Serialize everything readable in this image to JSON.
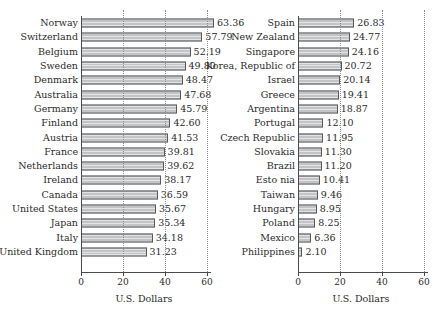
{
  "chart_data": [
    {
      "type": "bar",
      "orientation": "horizontal",
      "panel": "left",
      "title": "",
      "xlabel": "U.S. Dollars",
      "ylabel": "",
      "xlim": [
        0,
        60
      ],
      "xticks": [
        0,
        20,
        40,
        60
      ],
      "xticklabels": [
        "0",
        "20",
        "40",
        "60"
      ],
      "grid": "vertical-dotted",
      "legend": "none",
      "categories": [
        "Norway",
        "Switzerland",
        "Belgium",
        "Sweden",
        "Denmark",
        "Australia",
        "Germany",
        "Finland",
        "Austria",
        "France",
        "Netherlands",
        "Ireland",
        "Canada",
        "United States",
        "Japan",
        "Italy",
        "United Kingdom"
      ],
      "values": [
        63.36,
        57.79,
        52.19,
        49.8,
        48.47,
        47.68,
        45.79,
        42.6,
        41.53,
        39.81,
        39.62,
        38.17,
        36.59,
        35.67,
        35.34,
        34.18,
        31.23
      ],
      "data_labels": [
        "63.36",
        "57.79",
        "52.19",
        "49.80",
        "48.47",
        "47.68",
        "45.79",
        "42.60",
        "41.53",
        "39.81",
        "39.62",
        "38.17",
        "36.59",
        "35.67",
        "35.34",
        "34.18",
        "31.23"
      ]
    },
    {
      "type": "bar",
      "orientation": "horizontal",
      "panel": "right",
      "title": "",
      "xlabel": "U.S. Dollars",
      "ylabel": "",
      "xlim": [
        0,
        60
      ],
      "xticks": [
        0,
        20,
        40,
        60
      ],
      "xticklabels": [
        "0",
        "20",
        "40",
        "60"
      ],
      "grid": "vertical-dotted",
      "legend": "none",
      "categories": [
        "Spain",
        "New Zealand",
        "Singapore",
        "Korea, Republic of",
        "Israel",
        "Greece",
        "Argentina",
        "Portugal",
        "Czech Republic",
        "Slovakia",
        "Brazil",
        "Esto nia",
        "Taiwan",
        "Hungary",
        "Poland",
        "Mexico",
        "Philippines"
      ],
      "values": [
        26.83,
        24.77,
        24.16,
        20.72,
        20.14,
        19.41,
        18.87,
        12.1,
        11.95,
        11.3,
        11.2,
        10.41,
        9.46,
        8.95,
        8.25,
        6.36,
        2.1
      ],
      "data_labels": [
        "26.83",
        "24.77",
        "24.16",
        "20.72",
        "20.14",
        "19.41",
        "18.87",
        "12.10",
        "11.95",
        "11.30",
        "11.20",
        "10.41",
        "9.46",
        "8.95",
        "8.25",
        "6.36",
        "2.10"
      ]
    }
  ],
  "style": {
    "bar_fill": "#c3c4c5",
    "bar_border": "#55585c",
    "grid_color": "#8d8d8d",
    "axis_color": "#4a4a4a",
    "text_color": "#2b2b2b",
    "background": "#ffffff"
  }
}
